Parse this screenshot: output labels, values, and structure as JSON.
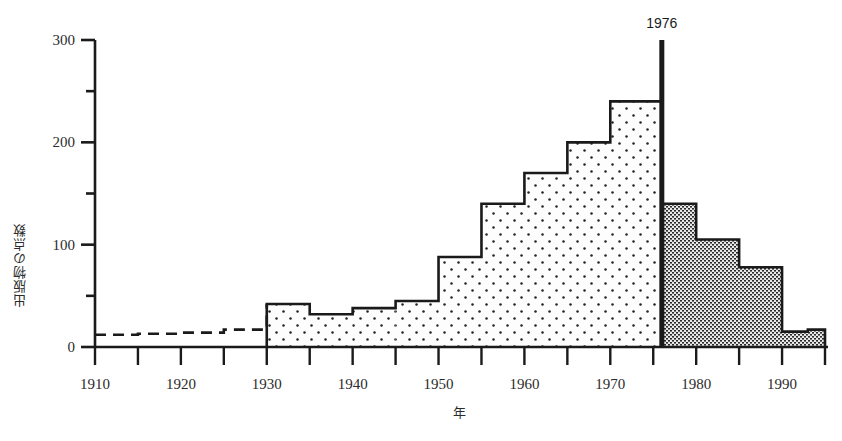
{
  "chart_data": {
    "type": "bar",
    "title": "",
    "xlabel": "年",
    "ylabel": "出版物の点数",
    "xlim": [
      1910,
      1995
    ],
    "ylim": [
      0,
      300
    ],
    "grid": false,
    "legend": null,
    "bin_width": 5,
    "y_ticks_major": [
      0,
      100,
      200,
      300
    ],
    "y_ticks_minor": [
      50,
      150,
      250
    ],
    "x_ticks_major": [
      1910,
      1920,
      1930,
      1940,
      1950,
      1960,
      1970,
      1980,
      1990
    ],
    "x_ticks_minor": [
      1915,
      1925,
      1935,
      1945,
      1955,
      1965,
      1975,
      1985,
      1995
    ],
    "x_tick_labels": [
      "1910",
      "1920",
      "1930",
      "1940",
      "1950",
      "1960",
      "1970",
      "1980",
      "1990"
    ],
    "y_tick_labels": [
      "0",
      "100",
      "200",
      "300"
    ],
    "annotations": [
      {
        "label": "1976",
        "x": 1976,
        "type": "vertical-line",
        "y_top": 300
      }
    ],
    "bins": [
      {
        "x0": 1910,
        "x1": 1915,
        "value": 12,
        "style": "dashed"
      },
      {
        "x0": 1915,
        "x1": 1920,
        "value": 13,
        "style": "dashed"
      },
      {
        "x0": 1920,
        "x1": 1925,
        "value": 14,
        "style": "dashed"
      },
      {
        "x0": 1925,
        "x1": 1930,
        "value": 17,
        "style": "dashed"
      },
      {
        "x0": 1930,
        "x1": 1935,
        "value": 42,
        "style": "dots"
      },
      {
        "x0": 1935,
        "x1": 1940,
        "value": 32,
        "style": "dots"
      },
      {
        "x0": 1940,
        "x1": 1945,
        "value": 38,
        "style": "dots"
      },
      {
        "x0": 1945,
        "x1": 1950,
        "value": 45,
        "style": "dots"
      },
      {
        "x0": 1950,
        "x1": 1955,
        "value": 88,
        "style": "dots"
      },
      {
        "x0": 1955,
        "x1": 1960,
        "value": 140,
        "style": "dots"
      },
      {
        "x0": 1960,
        "x1": 1965,
        "value": 170,
        "style": "dots"
      },
      {
        "x0": 1965,
        "x1": 1970,
        "value": 200,
        "style": "dots"
      },
      {
        "x0": 1970,
        "x1": 1976,
        "value": 240,
        "style": "dots"
      },
      {
        "x0": 1976,
        "x1": 1980,
        "value": 140,
        "style": "stipple"
      },
      {
        "x0": 1980,
        "x1": 1985,
        "value": 105,
        "style": "stipple"
      },
      {
        "x0": 1985,
        "x1": 1990,
        "value": 78,
        "style": "stipple"
      },
      {
        "x0": 1990,
        "x1": 1993,
        "value": 15,
        "style": "stipple"
      },
      {
        "x0": 1993,
        "x1": 1995,
        "value": 17,
        "style": "stipple"
      }
    ]
  },
  "colors": {
    "ink": "#1a1a1a",
    "text": "#2b2b2b",
    "background": "#ffffff",
    "fill_dots": "#fdfdfd",
    "fill_stipple": "#d8d8d8"
  }
}
